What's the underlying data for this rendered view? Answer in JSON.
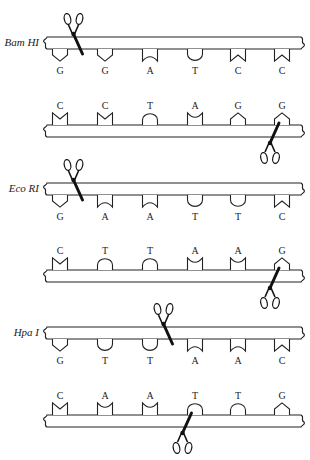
{
  "colors": {
    "ink": "#222222",
    "background": "#ffffff"
  },
  "enzymes": [
    {
      "name": "Bam HI",
      "top_strand": [
        "G",
        "G",
        "A",
        "T",
        "C",
        "C"
      ],
      "bottom_strand": [
        "C",
        "C",
        "T",
        "A",
        "G",
        "G"
      ],
      "top_cut_after_index": 0,
      "bottom_cut_after_index": 4
    },
    {
      "name": "Eco RI",
      "top_strand": [
        "G",
        "A",
        "A",
        "T",
        "T",
        "C"
      ],
      "bottom_strand": [
        "C",
        "T",
        "T",
        "A",
        "A",
        "G"
      ],
      "top_cut_after_index": 0,
      "bottom_cut_after_index": 4
    },
    {
      "name": "Hpa I",
      "top_strand": [
        "G",
        "T",
        "T",
        "A",
        "A",
        "C"
      ],
      "bottom_strand": [
        "C",
        "A",
        "A",
        "T",
        "T",
        "G"
      ],
      "top_cut_after_index": 2,
      "bottom_cut_after_index": 2
    }
  ],
  "icons": {
    "cut_marker": "scissors-icon"
  }
}
